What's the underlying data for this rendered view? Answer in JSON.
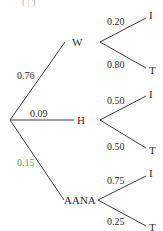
{
  "diagram": {
    "type": "probability-tree",
    "header_fragment": "( | )",
    "root": {
      "branches": [
        {
          "node": "W",
          "probability": "0.76",
          "children": [
            {
              "outcome": "I",
              "probability": "0.20"
            },
            {
              "outcome": "T",
              "probability": "0.80"
            }
          ]
        },
        {
          "node": "H",
          "probability": "0.09",
          "children": [
            {
              "outcome": "I",
              "probability": "0.50"
            },
            {
              "outcome": "T",
              "probability": "0.50"
            }
          ]
        },
        {
          "node": "AANA",
          "probability": "0.15",
          "children": [
            {
              "outcome": "I",
              "probability": "0.75"
            },
            {
              "outcome": "T",
              "probability": "0.25"
            }
          ]
        }
      ]
    },
    "colors": {
      "line": "#3a3a3a",
      "text": "#2a2a2a",
      "highlight_label": "#5a9a4a"
    }
  }
}
